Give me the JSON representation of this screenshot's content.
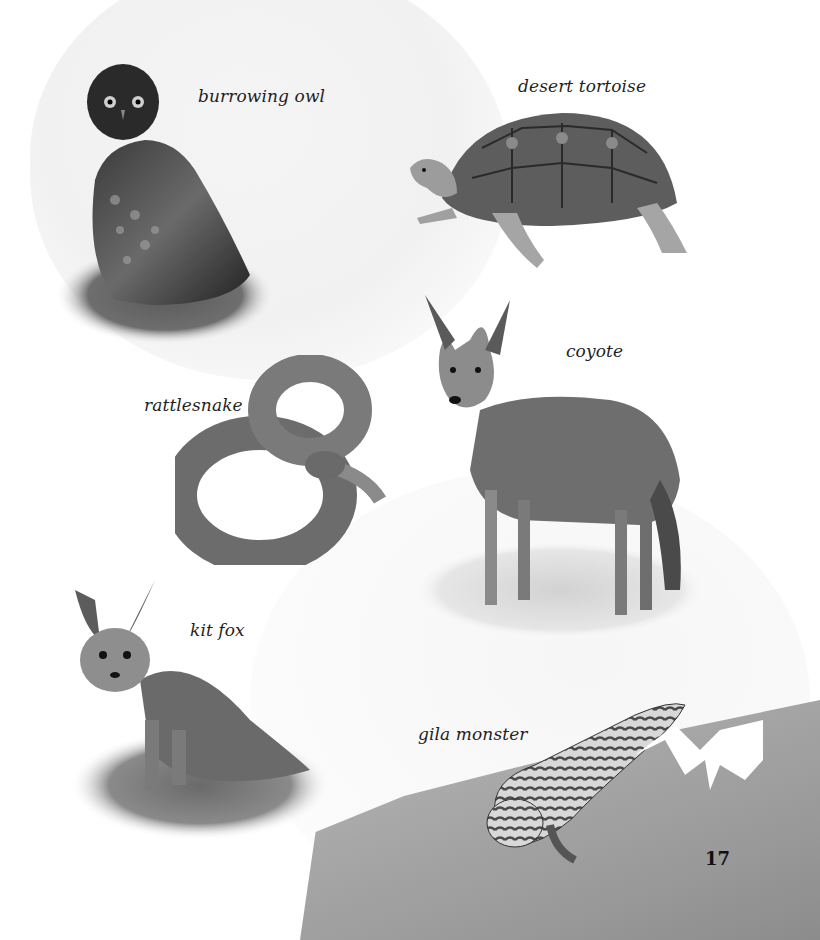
{
  "page": {
    "number": "17",
    "style": "grayscale",
    "background": "#ffffff"
  },
  "animals": [
    {
      "id": "burrowing-owl",
      "label": "burrowing owl"
    },
    {
      "id": "desert-tortoise",
      "label": "desert tortoise"
    },
    {
      "id": "coyote",
      "label": "coyote"
    },
    {
      "id": "rattlesnake",
      "label": "rattlesnake"
    },
    {
      "id": "kit-fox",
      "label": "kit fox"
    },
    {
      "id": "gila-monster",
      "label": "gila monster"
    }
  ]
}
